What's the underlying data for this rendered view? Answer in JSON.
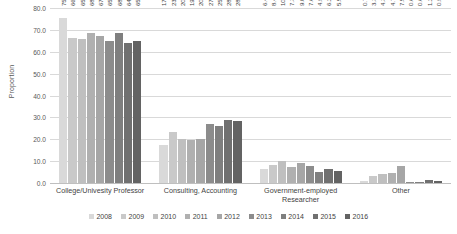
{
  "chart_data": {
    "type": "bar",
    "title": "",
    "xlabel": "",
    "ylabel": "Proportion",
    "ylim": [
      0.0,
      80.0
    ],
    "ytick_step": 10.0,
    "ytick_labels": [
      "0.0",
      "10.0",
      "20.0",
      "30.0",
      "40.0",
      "50.0",
      "60.0",
      "70.0",
      "80.0"
    ],
    "grid": true,
    "legend_position": "bottom",
    "orientation": "vertical",
    "grouping": "clustered",
    "data_label_rotation": "vertical",
    "categories": [
      "College/Univesity Professor",
      "Consulting, Accounting",
      "Government-employed Researcher",
      "Other"
    ],
    "series": [
      {
        "name": "2008",
        "color": "#d9d9d9",
        "values": [
          75.5,
          17.3,
          6.47,
          0.72
        ],
        "labels": [
          "75.5",
          "17.3",
          "6.47",
          "0.72"
        ]
      },
      {
        "name": "2009",
        "color": "#c9c9c9",
        "values": [
          66.2,
          23.1,
          8.46,
          3.31
        ],
        "labels": [
          "66.2",
          "23.1",
          "8.46",
          "3.31"
        ]
      },
      {
        "name": "2010",
        "color": "#bfbfbf",
        "values": [
          65.7,
          20.1,
          10.1,
          4.34
        ],
        "labels": [
          "65.7",
          "20.1",
          "10.1",
          "4.34"
        ]
      },
      {
        "name": "2011",
        "color": "#b0b0b0",
        "values": [
          68.5,
          19.5,
          7.38,
          4.7
        ],
        "labels": [
          "68.5",
          "19.5",
          "7.38",
          "4.7"
        ]
      },
      {
        "name": "2012",
        "color": "#a6a6a6",
        "values": [
          67.3,
          20.1,
          9.03,
          7.55
        ],
        "labels": [
          "67.3",
          "20.1",
          "9.03",
          "7.55"
        ]
      },
      {
        "name": "2013",
        "color": "#8c8c8c",
        "values": [
          65.0,
          27.2,
          7.6,
          0.6
        ],
        "labels": [
          "65.0",
          "27.2",
          "7.6",
          "0.6"
        ]
      },
      {
        "name": "2014",
        "color": "#7f7f7f",
        "values": [
          68.5,
          25.9,
          4.9,
          0.6
        ],
        "labels": [
          "68.5",
          "25.9",
          "4.9",
          "0.6"
        ]
      },
      {
        "name": "2015",
        "color": "#707070",
        "values": [
          64.0,
          28.6,
          6.2,
          1.2
        ],
        "labels": [
          "64.0",
          "28.6",
          "6.2",
          "1.2"
        ]
      },
      {
        "name": "2016",
        "color": "#636363",
        "values": [
          65.1,
          28.4,
          5.5,
          0.9
        ],
        "labels": [
          "65.1",
          "28.4",
          "5.5",
          "0.9"
        ]
      }
    ]
  }
}
